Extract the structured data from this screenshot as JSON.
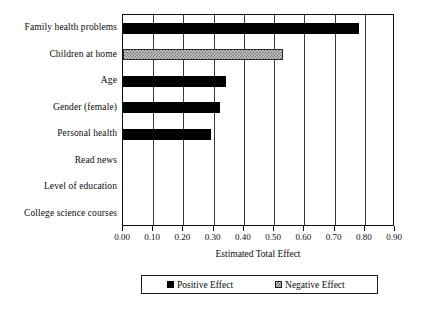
{
  "chart_data": {
    "type": "bar",
    "orientation": "horizontal",
    "title": "",
    "xlabel": "Estimated Total Effect",
    "ylabel": "",
    "xlim": [
      0.0,
      0.9
    ],
    "xticks": [
      "0.00",
      "0.10",
      "0.20",
      "0.30",
      "0.40",
      "0.50",
      "0.60",
      "0.70",
      "0.80",
      "0.90"
    ],
    "xtick_values": [
      0.0,
      0.1,
      0.2,
      0.3,
      0.4,
      0.5,
      0.6,
      0.7,
      0.8,
      0.9
    ],
    "grid": "vertical",
    "legend_position": "bottom",
    "categories": [
      "Family health problems",
      "Children at home",
      "Age",
      "Gender (female)",
      "Personal health",
      "Read news",
      "Level of education",
      "College science courses"
    ],
    "values": [
      0.78,
      0.53,
      0.34,
      0.32,
      0.29,
      0.0,
      0.0,
      0.0
    ],
    "effect_types": [
      "positive",
      "negative",
      "positive",
      "positive",
      "positive",
      "none",
      "none",
      "none"
    ],
    "series": [
      {
        "name": "Positive Effect",
        "values": [
          0.78,
          0.0,
          0.34,
          0.32,
          0.29,
          0.0,
          0.0,
          0.0
        ]
      },
      {
        "name": "Negative Effect",
        "values": [
          0.0,
          0.53,
          0.0,
          0.0,
          0.0,
          0.0,
          0.0,
          0.0
        ]
      }
    ],
    "legend": [
      {
        "label": "Positive Effect",
        "swatch": "solid-black"
      },
      {
        "label": "Negative Effect",
        "swatch": "hatched-gray"
      }
    ],
    "colors": {
      "positive": "#000000",
      "negative": "#c9c9c9",
      "axis": "#111111",
      "grid": "#3a3a3a",
      "background": "#ffffff"
    }
  }
}
